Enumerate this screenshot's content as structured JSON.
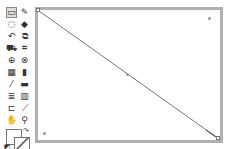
{
  "toolbar": {
    "tools": [
      {
        "name": "marquee-select",
        "glyph": "▭"
      },
      {
        "name": "pencil",
        "glyph": "✎"
      },
      {
        "name": "lasso",
        "glyph": "◌"
      },
      {
        "name": "fill",
        "glyph": "◆"
      },
      {
        "name": "rotate",
        "glyph": "↶"
      },
      {
        "name": "scale",
        "glyph": "⧉"
      },
      {
        "name": "paint-bucket",
        "glyph": "⛟"
      },
      {
        "name": "crop-frame",
        "glyph": "⌗"
      },
      {
        "name": "zoom-select",
        "glyph": "⊕"
      },
      {
        "name": "node-edit",
        "glyph": "⊗"
      },
      {
        "name": "grid",
        "glyph": "▦"
      },
      {
        "name": "gradient",
        "glyph": "▮"
      },
      {
        "name": "eyedropper",
        "glyph": "⁄"
      },
      {
        "name": "eraser",
        "glyph": "▬"
      },
      {
        "name": "text-align",
        "glyph": "≣"
      },
      {
        "name": "chart",
        "glyph": "▥"
      },
      {
        "name": "crop",
        "glyph": "⊏"
      },
      {
        "name": "dropper",
        "glyph": "⟋"
      },
      {
        "name": "pan-hand",
        "glyph": "✋"
      },
      {
        "name": "magnify",
        "glyph": "⚲"
      }
    ],
    "colors": {
      "foreground": "#ffffff",
      "background": "#ffffff"
    }
  },
  "canvas": {
    "frame_color": "#b0b0b0",
    "line": {
      "from": "top-left",
      "to": "bottom-right",
      "color": "#777777"
    }
  }
}
